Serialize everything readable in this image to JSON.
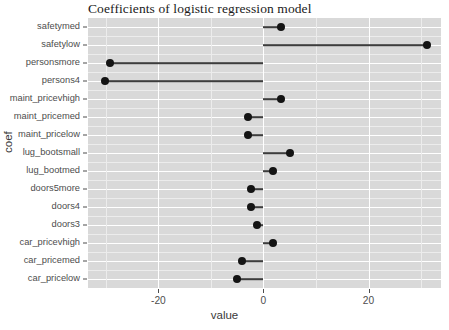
{
  "chart_data": {
    "type": "bar",
    "title": "Coefficients of logistic regression model",
    "xlabel": "value",
    "ylabel": "coef",
    "xlim": [
      -33.4,
      33.8
    ],
    "xticks": [
      -20,
      0,
      20
    ],
    "xtick_labels": [
      "-20",
      "0",
      "20"
    ],
    "grid": true,
    "legend": "none",
    "orientation": "horizontal",
    "baseline": 0,
    "categories": [
      "safetymed",
      "safetylow",
      "personsmore",
      "persons4",
      "maint_pricevhigh",
      "maint_pricemed",
      "maint_pricelow",
      "lug_bootsmall",
      "lug_bootmed",
      "doors5more",
      "doors4",
      "doors3",
      "car_pricevhigh",
      "car_pricemed",
      "car_pricelow"
    ],
    "values": [
      3.4,
      31.2,
      -29.3,
      -30.1,
      3.3,
      -3.0,
      -3.0,
      5.0,
      1.8,
      -2.3,
      -2.3,
      -1.3,
      1.8,
      -4.0,
      -5.0
    ]
  },
  "style": {
    "panel_fill": "#d9d9d9",
    "grid_major": "#ffffff",
    "grid_minor": "#ececec",
    "point_color": "#141414",
    "segment_color": "#3d3d3d",
    "axis_text": "#4d4d4d",
    "title_color": "#1a1a1a"
  }
}
